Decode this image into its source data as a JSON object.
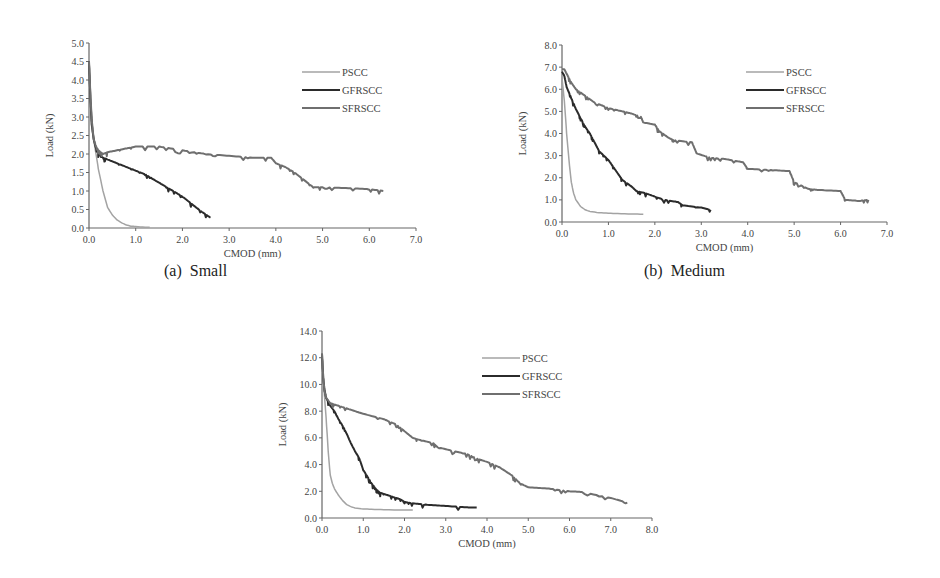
{
  "figure": {
    "captions": [
      "(a)  Small",
      "(b)  Medium"
    ]
  },
  "chart_data": [
    {
      "id": "a",
      "type": "line",
      "title": "(a)  Small",
      "xlabel": "CMOD (mm)",
      "ylabel": "Load (kN)",
      "xlim": [
        0,
        7.0
      ],
      "ylim": [
        0,
        5.0
      ],
      "xticks": [
        "0.0",
        "1.0",
        "2.0",
        "3.0",
        "4.0",
        "5.0",
        "6.0",
        "7.0"
      ],
      "yticks": [
        "0.0",
        "0.5",
        "1.0",
        "1.5",
        "2.0",
        "2.5",
        "3.0",
        "3.5",
        "4.0",
        "4.5",
        "5.0"
      ],
      "legend": {
        "position": "upper right",
        "entries": [
          "PSCC",
          "GFRSCC",
          "SFRSCC"
        ]
      },
      "grid": false,
      "series": [
        {
          "name": "PSCC",
          "color": "#a3a3a3",
          "x": [
            0,
            0.02,
            0.05,
            0.1,
            0.15,
            0.2,
            0.3,
            0.4,
            0.5,
            0.6,
            0.7,
            0.8,
            0.9,
            1.0,
            1.2,
            1.3
          ],
          "y": [
            4.4,
            3.6,
            2.8,
            2.4,
            2.0,
            1.6,
            1.0,
            0.55,
            0.35,
            0.22,
            0.14,
            0.08,
            0.05,
            0.04,
            0.02,
            0.02
          ]
        },
        {
          "name": "GFRSCC",
          "color": "#2b2b2b",
          "x": [
            0,
            0.03,
            0.06,
            0.1,
            0.15,
            0.2,
            0.3,
            0.4,
            0.6,
            0.8,
            1.0,
            1.2,
            1.4,
            1.6,
            1.8,
            2.0,
            2.2,
            2.4,
            2.6
          ],
          "y": [
            4.5,
            3.5,
            2.8,
            2.4,
            2.15,
            2.0,
            1.9,
            1.85,
            1.75,
            1.65,
            1.55,
            1.45,
            1.3,
            1.15,
            1.0,
            0.85,
            0.65,
            0.45,
            0.28
          ]
        },
        {
          "name": "SFRSCC",
          "color": "#6f6f6f",
          "x": [
            0,
            0.03,
            0.06,
            0.1,
            0.15,
            0.2,
            0.3,
            0.4,
            0.6,
            0.8,
            1.0,
            1.5,
            2.0,
            2.5,
            3.0,
            3.5,
            3.9,
            4.0,
            4.2,
            4.4,
            4.6,
            4.8,
            5.0,
            5.5,
            6.0,
            6.3
          ],
          "y": [
            4.5,
            3.6,
            2.9,
            2.4,
            2.2,
            2.1,
            2.0,
            2.05,
            2.1,
            2.15,
            2.2,
            2.2,
            2.1,
            2.0,
            1.95,
            1.9,
            1.9,
            1.75,
            1.65,
            1.5,
            1.3,
            1.1,
            1.1,
            1.08,
            1.05,
            1.0
          ]
        }
      ]
    },
    {
      "id": "b",
      "type": "line",
      "title": "(b)  Medium",
      "xlabel": "CMOD (mm)",
      "ylabel": "Load (kN)",
      "xlim": [
        0,
        7.0
      ],
      "ylim": [
        0,
        8.0
      ],
      "xticks": [
        "0.0",
        "1.0",
        "2.0",
        "3.0",
        "4.0",
        "5.0",
        "6.0",
        "7.0"
      ],
      "yticks": [
        "0.0",
        "1.0",
        "2.0",
        "3.0",
        "4.0",
        "5.0",
        "6.0",
        "7.0",
        "8.0"
      ],
      "legend": {
        "position": "upper right",
        "entries": [
          "PSCC",
          "GFRSCC",
          "SFRSCC"
        ]
      },
      "grid": false,
      "series": [
        {
          "name": "PSCC",
          "color": "#a3a3a3",
          "x": [
            0,
            0.05,
            0.1,
            0.15,
            0.2,
            0.25,
            0.3,
            0.4,
            0.5,
            0.6,
            0.8,
            1.0,
            1.2,
            1.5,
            1.75
          ],
          "y": [
            6.5,
            5.5,
            4.0,
            2.8,
            1.8,
            1.3,
            1.0,
            0.7,
            0.55,
            0.48,
            0.42,
            0.4,
            0.38,
            0.36,
            0.35
          ]
        },
        {
          "name": "GFRSCC",
          "color": "#2b2b2b",
          "x": [
            0,
            0.05,
            0.1,
            0.2,
            0.3,
            0.4,
            0.5,
            0.6,
            0.7,
            0.8,
            0.9,
            1.0,
            1.1,
            1.2,
            1.3,
            1.5,
            1.6,
            1.8,
            2.0,
            2.2,
            2.5,
            2.6,
            3.0,
            3.2
          ],
          "y": [
            6.8,
            6.6,
            6.1,
            5.6,
            5.1,
            4.7,
            4.3,
            4.0,
            3.6,
            3.2,
            3.0,
            2.8,
            2.5,
            2.2,
            1.9,
            1.6,
            1.4,
            1.3,
            1.15,
            1.0,
            0.9,
            0.75,
            0.65,
            0.55
          ]
        },
        {
          "name": "SFRSCC",
          "color": "#6f6f6f",
          "x": [
            0,
            0.05,
            0.1,
            0.2,
            0.3,
            0.5,
            0.7,
            1.0,
            1.3,
            1.5,
            1.7,
            1.75,
            2.0,
            2.1,
            2.3,
            2.4,
            2.8,
            2.9,
            3.2,
            3.5,
            3.9,
            4.0,
            4.5,
            4.9,
            5.0,
            5.3,
            5.5,
            6.0,
            6.1,
            6.4,
            6.6
          ],
          "y": [
            6.9,
            6.9,
            6.7,
            6.3,
            6.0,
            5.7,
            5.4,
            5.15,
            5.0,
            4.9,
            4.75,
            4.5,
            4.4,
            4.1,
            3.8,
            3.7,
            3.6,
            3.1,
            2.9,
            2.85,
            2.7,
            2.4,
            2.35,
            2.3,
            1.8,
            1.5,
            1.45,
            1.4,
            1.0,
            0.95,
            1.0
          ]
        }
      ]
    },
    {
      "id": "c",
      "type": "line",
      "title": "",
      "xlabel": "CMOD (mm)",
      "ylabel": "Load (kN)",
      "xlim": [
        0,
        8.0
      ],
      "ylim": [
        0,
        14.0
      ],
      "xticks": [
        "0.0",
        "1.0",
        "2.0",
        "3.0",
        "4.0",
        "5.0",
        "6.0",
        "7.0",
        "8.0"
      ],
      "yticks": [
        "0.0",
        "2.0",
        "4.0",
        "6.0",
        "8.0",
        "10.0",
        "12.0",
        "14.0"
      ],
      "legend": {
        "position": "upper right",
        "entries": [
          "PSCC",
          "GFRSCC",
          "SFRSCC"
        ]
      },
      "grid": false,
      "series": [
        {
          "name": "PSCC",
          "color": "#a3a3a3",
          "x": [
            0,
            0.05,
            0.1,
            0.15,
            0.2,
            0.25,
            0.3,
            0.4,
            0.5,
            0.6,
            0.7,
            0.8,
            1.0,
            1.2,
            1.5,
            2.0,
            2.2
          ],
          "y": [
            11.0,
            9.5,
            7.5,
            5.0,
            3.2,
            2.6,
            2.2,
            1.7,
            1.3,
            1.0,
            0.85,
            0.75,
            0.68,
            0.65,
            0.62,
            0.6,
            0.6
          ]
        },
        {
          "name": "GFRSCC",
          "color": "#2b2b2b",
          "x": [
            0,
            0.03,
            0.06,
            0.1,
            0.2,
            0.3,
            0.4,
            0.5,
            0.6,
            0.7,
            0.8,
            0.9,
            1.0,
            1.1,
            1.2,
            1.3,
            1.4,
            1.5,
            1.7,
            1.9,
            2.0,
            2.2,
            2.5,
            3.0,
            3.5,
            3.75
          ],
          "y": [
            12.3,
            10.5,
            9.6,
            9.0,
            8.4,
            8.0,
            7.4,
            6.9,
            6.3,
            5.6,
            5.0,
            4.5,
            3.6,
            3.1,
            2.6,
            2.2,
            1.9,
            1.8,
            1.6,
            1.4,
            1.2,
            1.1,
            1.0,
            0.9,
            0.8,
            0.78
          ]
        },
        {
          "name": "SFRSCC",
          "color": "#6f6f6f",
          "x": [
            0,
            0.03,
            0.06,
            0.1,
            0.2,
            0.3,
            0.5,
            0.8,
            1.0,
            1.5,
            1.8,
            2.0,
            2.2,
            2.3,
            2.7,
            2.8,
            3.2,
            3.5,
            3.8,
            4.0,
            4.3,
            4.6,
            4.8,
            5.0,
            5.5,
            6.0,
            6.3,
            7.0,
            7.4
          ],
          "y": [
            12.3,
            10.5,
            9.5,
            9.0,
            8.6,
            8.5,
            8.3,
            8.0,
            7.8,
            7.4,
            7.0,
            6.5,
            6.0,
            5.9,
            5.6,
            5.3,
            5.0,
            4.8,
            4.4,
            4.2,
            3.8,
            3.2,
            2.6,
            2.3,
            2.2,
            2.0,
            1.95,
            1.5,
            1.15
          ]
        }
      ]
    }
  ]
}
